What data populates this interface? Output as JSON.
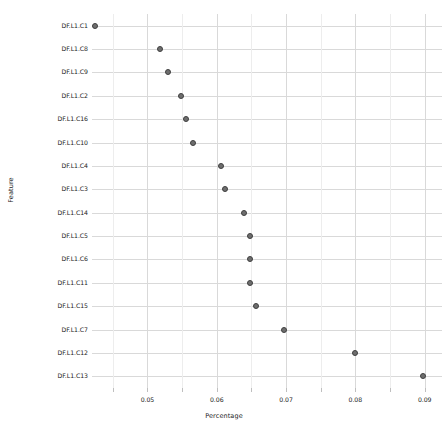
{
  "chart_data": {
    "type": "scatter",
    "title": "",
    "xlabel": "Percentage",
    "ylabel": "Feature",
    "orientation": "horizontal",
    "grid": true,
    "legend": false,
    "xlim": [
      0.042,
      0.0925
    ],
    "xticks": [
      0.05,
      0.06,
      0.07,
      0.08,
      0.09
    ],
    "xticklabels": [
      "0.05",
      "0.06",
      "0.07",
      "0.08",
      "0.09"
    ],
    "categories": [
      "DF.L1.C1",
      "DF.L1.C8",
      "DF.L1.C9",
      "DF.L1.C2",
      "DF.L1.C16",
      "DF.L1.C10",
      "DF.L1.C4",
      "DF.L1.C3",
      "DF.L1.C14",
      "DF.L1.C5",
      "DF.L1.C6",
      "DF.L1.C11",
      "DF.L1.C15",
      "DF.L1.C7",
      "DF.L1.C12",
      "DF.L1.C13"
    ],
    "values": [
      0.0424,
      0.0518,
      0.053,
      0.0549,
      0.0555,
      0.0566,
      0.0606,
      0.0612,
      0.064,
      0.0648,
      0.0648,
      0.0648,
      0.0657,
      0.0697,
      0.08,
      0.0898
    ],
    "marker": {
      "shape": "circle",
      "fill_color": "#6e6e6e",
      "edge_color": "#3f3f3f",
      "size_px": 6
    },
    "colors": {
      "background": "#ffffff",
      "grid": "#d9d9d9",
      "grid_minor": "#ededed",
      "text": "#1a1a1a",
      "axis_title": "#222222"
    }
  }
}
